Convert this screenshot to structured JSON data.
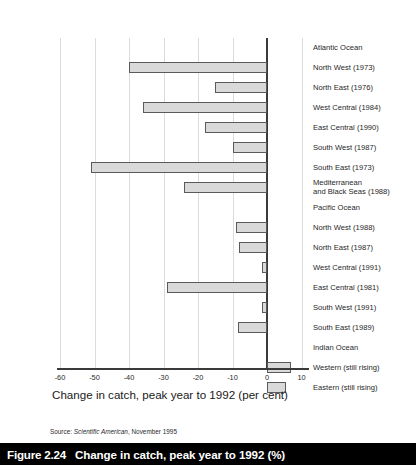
{
  "figure": {
    "caption_number": "Figure 2.24",
    "caption_text": "Change in catch, peak year to 1992 (%)",
    "source": "Source: ",
    "source_italic": "Scientific American",
    "source_rest": ", November 1995"
  },
  "chart_data": {
    "type": "bar",
    "orientation": "horizontal",
    "title": "",
    "xlabel": "Change in catch, peak year to 1992 (per cent)",
    "ylabel": "",
    "xlim": [
      -62,
      12
    ],
    "xticks": [
      -60,
      -50,
      -40,
      -30,
      -20,
      -10,
      0,
      10
    ],
    "xticklabels": [
      "-60",
      "-50",
      "-40",
      "-30",
      "-20",
      "-10",
      "0",
      "10"
    ],
    "grid": "vertical",
    "legend": "none",
    "rows": [
      {
        "label": "Atlantic Ocean",
        "type": "group",
        "value": null
      },
      {
        "label": "North West (1973)",
        "type": "bar",
        "value": -40
      },
      {
        "label": "North East (1976)",
        "type": "bar",
        "value": -15
      },
      {
        "label": "West Central (1984)",
        "type": "bar",
        "value": -36
      },
      {
        "label": "East Central (1990)",
        "type": "bar",
        "value": -18
      },
      {
        "label": "South West (1987)",
        "type": "bar",
        "value": -10
      },
      {
        "label": "South East (1973)",
        "type": "bar",
        "value": -51
      },
      {
        "label": "Mediterranean\nand Black Seas (1988)",
        "type": "group-bar",
        "value": -24
      },
      {
        "label": "Pacific Ocean",
        "type": "group",
        "value": null
      },
      {
        "label": "North West (1988)",
        "type": "bar",
        "value": -9
      },
      {
        "label": "North East (1987)",
        "type": "bar",
        "value": -8
      },
      {
        "label": "West Central (1991)",
        "type": "bar",
        "value": -1.5
      },
      {
        "label": "East Central (1981)",
        "type": "bar",
        "value": -29
      },
      {
        "label": "South West (1991)",
        "type": "bar",
        "value": -1.5
      },
      {
        "label": "South East (1989)",
        "type": "bar",
        "value": -8.5
      },
      {
        "label": "Indian Ocean",
        "type": "group",
        "value": null
      },
      {
        "label": "Western (still rising)",
        "type": "bar",
        "value": 7
      },
      {
        "label": "Eastern (still rising)",
        "type": "bar",
        "value": 5.5
      }
    ],
    "colors": {
      "bar_fill": "#d9d9d9",
      "bar_border": "#5a5a5a",
      "gridline": "#dcdcdc",
      "axis": "#3a3a3a",
      "caption_bar": "#000000",
      "caption_text": "#ffffff"
    }
  }
}
